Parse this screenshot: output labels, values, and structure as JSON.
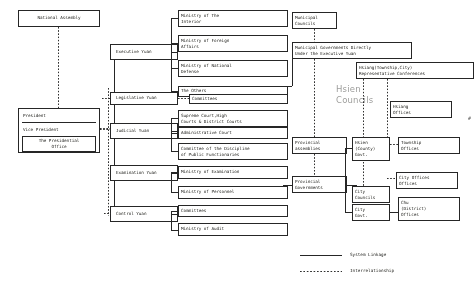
{
  "diagram": {
    "legend": {
      "system_linkage": "System Linkage",
      "interrelationship": "Interrelationship"
    },
    "annotation": {
      "hsien_councils": "Hsien\nCouncils"
    },
    "marker": "#",
    "nodes": {
      "national_assembly": "National Assembly",
      "president": "President",
      "vice_president": "Vice President",
      "presidential_office": "The Presidential\nOffice",
      "executive_yuan": "Executive Yuan",
      "legislative_yuan": "Legislative Yuan",
      "judicial_yuan": "Judicial Yuan",
      "examination_yuan": "Examination Yuan",
      "control_yuan": "Control Yuan",
      "ministry_interior": "Ministry of The\nInterior",
      "ministry_foreign": "Ministry of Foreign\nAffairs",
      "ministry_defense": "Ministry of National\nDefense",
      "the_others": "The Others",
      "committees_legislative": "Committees",
      "supreme_court": "Supreme Court,High\nCourts & District Courts",
      "administrative_court": "Administrative Court",
      "committee_discipline": "Committee of the Discipline\nof Public Functionaries",
      "ministry_examination": "Ministry of Examination",
      "ministry_personnel": "Ministry of Personnel",
      "committees_control": "Committees",
      "ministry_audit": "Ministry of Audit",
      "municipal_councils": "Municipal\nCouncils",
      "municipal_governments": "Municipal Governments Directly\nUnder the Executive Yuan",
      "hsiang_conferences": "Hsiang(Township,City)\nRepresentative Conferences",
      "hsiang_offices": "Hsiang\nOffices",
      "provincial_assemblies": "Provincial\nassemblies",
      "provincial_governments": "Provincial\nGovernments",
      "hsien_county_govt": "Hsien\n(County)\nGovt.",
      "township_offices": "Township\nOffices",
      "city_offices": "City Offices\nOffices",
      "city_councils": "City\nCouncils",
      "city_govt": "City\nGovt.",
      "chu_district_offices": "Chu\n(District)\nOffices"
    }
  }
}
